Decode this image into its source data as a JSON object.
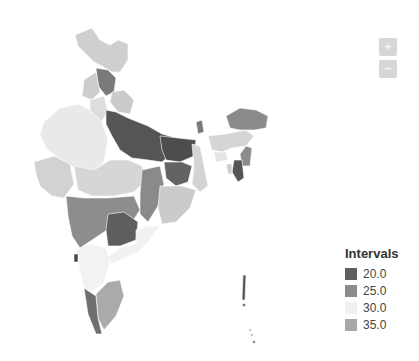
{
  "map": {
    "title": "India choropleth map",
    "region": "India states"
  },
  "controls": {
    "zoom_in_label": "+",
    "zoom_out_label": "−"
  },
  "legend": {
    "title": "Intervals",
    "items": [
      {
        "label": "20.0",
        "color": "#5f5f5f"
      },
      {
        "label": "25.0",
        "color": "#8c8c8c"
      },
      {
        "label": "30.0",
        "color": "#f0f0f0"
      },
      {
        "label": "35.0",
        "color": "#a8a8a8"
      }
    ]
  },
  "colors": {
    "c20": "#5f5f5f",
    "c25": "#8c8c8c",
    "c30": "#ececec",
    "c35": "#b5b5b5",
    "light": "#d8d8d8"
  }
}
